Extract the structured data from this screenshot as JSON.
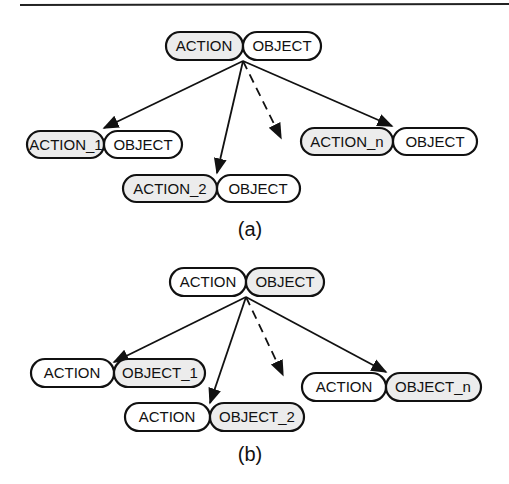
{
  "figure": {
    "colors": {
      "stroke": "#111111",
      "shaded_fill": "#ececec",
      "plain_fill": "#ffffff"
    },
    "panels": [
      {
        "caption": "(a)",
        "root": {
          "action": "ACTION",
          "object": "OBJECT",
          "shaded": "action"
        },
        "children": [
          {
            "action": "ACTION_1",
            "object": "OBJECT",
            "shaded": "action"
          },
          {
            "action": "ACTION_2",
            "object": "OBJECT",
            "shaded": "action"
          },
          {
            "action": "ACTION_n",
            "object": "OBJECT",
            "shaded": "action"
          }
        ],
        "ellipsis_arrow": "dashed"
      },
      {
        "caption": "(b)",
        "root": {
          "action": "ACTION",
          "object": "OBJECT",
          "shaded": "object"
        },
        "children": [
          {
            "action": "ACTION",
            "object": "OBJECT_1",
            "shaded": "object"
          },
          {
            "action": "ACTION",
            "object": "OBJECT_2",
            "shaded": "object"
          },
          {
            "action": "ACTION",
            "object": "OBJECT_n",
            "shaded": "object"
          }
        ],
        "ellipsis_arrow": "dashed"
      }
    ]
  }
}
